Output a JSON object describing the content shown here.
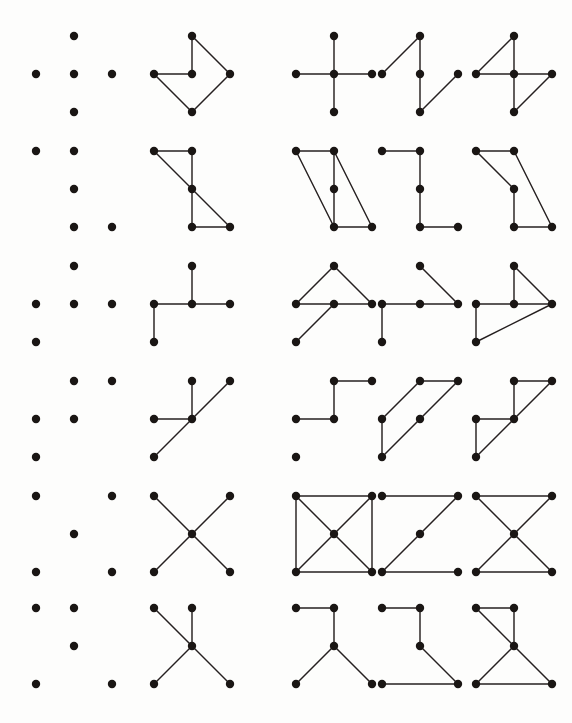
{
  "figure": {
    "background_color": "#fdfdfc",
    "dot_color": "#1a1614",
    "line_color": "#262020",
    "rows_count": 6,
    "columns_count": 5,
    "grid": {
      "cols_x": [
        14,
        52,
        90
      ],
      "rows_y": [
        16,
        54,
        92
      ],
      "dot_radius": 4.2
    },
    "column_x_offsets": [
      22,
      140,
      282,
      368,
      462
    ],
    "row_y_offsets": [
      20,
      135,
      250,
      365,
      480,
      592
    ],
    "rows": [
      {
        "row_index": 1,
        "pattern_name": "plus-cross",
        "dots": [
          {
            "id": "tc",
            "col": 1,
            "row": 0
          },
          {
            "id": "ml",
            "col": 0,
            "row": 1
          },
          {
            "id": "mc",
            "col": 1,
            "row": 1
          },
          {
            "id": "mr",
            "col": 2,
            "row": 1
          },
          {
            "id": "bc",
            "col": 1,
            "row": 2
          }
        ],
        "cells": [
          {
            "cell_index": 1,
            "name": "dots-only",
            "edges": []
          },
          {
            "cell_index": 2,
            "name": "arrowhead-figure",
            "edges": [
              [
                "tc",
                "mc"
              ],
              [
                "ml",
                "mc"
              ],
              [
                "tc",
                "mr"
              ],
              [
                "ml",
                "bc"
              ],
              [
                "bc",
                "mr"
              ]
            ]
          },
          {
            "cell_index": 3,
            "name": "full-plus-figure",
            "edges": [
              [
                "tc",
                "mc"
              ],
              [
                "ml",
                "mc"
              ],
              [
                "mc",
                "mr"
              ],
              [
                "mc",
                "bc"
              ]
            ]
          },
          {
            "cell_index": 4,
            "name": "zigzag-figure",
            "edges": [
              [
                "tc",
                "ml"
              ],
              [
                "tc",
                "mc"
              ],
              [
                "mc",
                "bc"
              ],
              [
                "bc",
                "mr"
              ]
            ]
          },
          {
            "cell_index": 5,
            "name": "four-figure",
            "edges": [
              [
                "tc",
                "ml"
              ],
              [
                "tc",
                "mc"
              ],
              [
                "ml",
                "mc"
              ],
              [
                "mc",
                "mr"
              ],
              [
                "mc",
                "bc"
              ],
              [
                "bc",
                "mr"
              ]
            ]
          }
        ]
      },
      {
        "row_index": 2,
        "pattern_name": "z-stack",
        "dots": [
          {
            "id": "tl",
            "col": 0,
            "row": 0
          },
          {
            "id": "tc",
            "col": 1,
            "row": 0
          },
          {
            "id": "mc",
            "col": 1,
            "row": 1
          },
          {
            "id": "bc",
            "col": 1,
            "row": 2
          },
          {
            "id": "br",
            "col": 2,
            "row": 2
          }
        ],
        "cells": [
          {
            "cell_index": 1,
            "name": "dots-only",
            "edges": []
          },
          {
            "cell_index": 2,
            "name": "z-figure",
            "edges": [
              [
                "tl",
                "tc"
              ],
              [
                "tl",
                "mc"
              ],
              [
                "tc",
                "mc"
              ],
              [
                "mc",
                "bc"
              ],
              [
                "mc",
                "br"
              ],
              [
                "bc",
                "br"
              ]
            ]
          },
          {
            "cell_index": 3,
            "name": "parallelogram-figure",
            "edges": [
              [
                "tl",
                "tc"
              ],
              [
                "tl",
                "bc"
              ],
              [
                "tc",
                "mc"
              ],
              [
                "mc",
                "bc"
              ],
              [
                "tc",
                "br"
              ],
              [
                "bc",
                "br"
              ]
            ]
          },
          {
            "cell_index": 4,
            "name": "l-figure",
            "edges": [
              [
                "tl",
                "tc"
              ],
              [
                "tc",
                "mc"
              ],
              [
                "mc",
                "bc"
              ],
              [
                "bc",
                "br"
              ]
            ]
          },
          {
            "cell_index": 5,
            "name": "seven-figure",
            "edges": [
              [
                "tl",
                "tc"
              ],
              [
                "tl",
                "mc"
              ],
              [
                "tc",
                "br"
              ],
              [
                "mc",
                "bc"
              ],
              [
                "bc",
                "br"
              ]
            ]
          }
        ]
      },
      {
        "row_index": 3,
        "pattern_name": "t-with-tail",
        "dots": [
          {
            "id": "tc",
            "col": 1,
            "row": 0
          },
          {
            "id": "ml",
            "col": 0,
            "row": 1
          },
          {
            "id": "mc",
            "col": 1,
            "row": 1
          },
          {
            "id": "mr",
            "col": 2,
            "row": 1
          },
          {
            "id": "bl",
            "col": 0,
            "row": 2
          }
        ],
        "cells": [
          {
            "cell_index": 1,
            "name": "dots-only",
            "edges": []
          },
          {
            "cell_index": 2,
            "name": "t-figure",
            "edges": [
              [
                "tc",
                "mc"
              ],
              [
                "ml",
                "mc"
              ],
              [
                "mc",
                "mr"
              ],
              [
                "ml",
                "bl"
              ]
            ]
          },
          {
            "cell_index": 3,
            "name": "triangle-tail-figure",
            "edges": [
              [
                "tc",
                "ml"
              ],
              [
                "tc",
                "mr"
              ],
              [
                "ml",
                "mc"
              ],
              [
                "mc",
                "mr"
              ],
              [
                "mc",
                "bl"
              ]
            ]
          },
          {
            "cell_index": 4,
            "name": "r-figure",
            "edges": [
              [
                "tc",
                "mr"
              ],
              [
                "ml",
                "mc"
              ],
              [
                "mc",
                "mr"
              ],
              [
                "ml",
                "bl"
              ]
            ]
          },
          {
            "cell_index": 5,
            "name": "kite-figure",
            "edges": [
              [
                "tc",
                "mc"
              ],
              [
                "tc",
                "mr"
              ],
              [
                "ml",
                "mc"
              ],
              [
                "mc",
                "mr"
              ],
              [
                "ml",
                "bl"
              ],
              [
                "bl",
                "mr"
              ]
            ]
          }
        ]
      },
      {
        "row_index": 4,
        "pattern_name": "diagonal-stair",
        "dots": [
          {
            "id": "tc",
            "col": 1,
            "row": 0
          },
          {
            "id": "tr",
            "col": 2,
            "row": 0
          },
          {
            "id": "ml",
            "col": 0,
            "row": 1
          },
          {
            "id": "mc",
            "col": 1,
            "row": 1
          },
          {
            "id": "bl",
            "col": 0,
            "row": 2
          }
        ],
        "cells": [
          {
            "cell_index": 1,
            "name": "dots-only",
            "edges": []
          },
          {
            "cell_index": 2,
            "name": "star-figure",
            "edges": [
              [
                "tc",
                "mc"
              ],
              [
                "ml",
                "mc"
              ],
              [
                "mc",
                "tr"
              ],
              [
                "mc",
                "bl"
              ]
            ]
          },
          {
            "cell_index": 3,
            "name": "step-figure",
            "edges": [
              [
                "tc",
                "tr"
              ],
              [
                "tc",
                "mc"
              ],
              [
                "ml",
                "mc"
              ]
            ]
          },
          {
            "cell_index": 4,
            "name": "double-diagonal-figure",
            "edges": [
              [
                "tc",
                "tr"
              ],
              [
                "tc",
                "ml"
              ],
              [
                "ml",
                "bl"
              ],
              [
                "mc",
                "tr"
              ],
              [
                "bl",
                "mc"
              ]
            ]
          },
          {
            "cell_index": 5,
            "name": "flag-figure",
            "edges": [
              [
                "tc",
                "tr"
              ],
              [
                "tc",
                "mc"
              ],
              [
                "ml",
                "mc"
              ],
              [
                "mc",
                "tr"
              ],
              [
                "ml",
                "bl"
              ],
              [
                "bl",
                "mc"
              ]
            ]
          }
        ]
      },
      {
        "row_index": 5,
        "pattern_name": "x-corners",
        "dots": [
          {
            "id": "tl",
            "col": 0,
            "row": 0
          },
          {
            "id": "tr",
            "col": 2,
            "row": 0
          },
          {
            "id": "mc",
            "col": 1,
            "row": 1
          },
          {
            "id": "bl",
            "col": 0,
            "row": 2
          },
          {
            "id": "br",
            "col": 2,
            "row": 2
          }
        ],
        "cells": [
          {
            "cell_index": 1,
            "name": "dots-only",
            "edges": []
          },
          {
            "cell_index": 2,
            "name": "x-figure",
            "edges": [
              [
                "tl",
                "mc"
              ],
              [
                "tr",
                "mc"
              ],
              [
                "bl",
                "mc"
              ],
              [
                "br",
                "mc"
              ]
            ]
          },
          {
            "cell_index": 3,
            "name": "boxed-x-figure",
            "edges": [
              [
                "tl",
                "tr"
              ],
              [
                "tl",
                "bl"
              ],
              [
                "tr",
                "br"
              ],
              [
                "bl",
                "br"
              ],
              [
                "tl",
                "mc"
              ],
              [
                "tr",
                "mc"
              ],
              [
                "bl",
                "mc"
              ],
              [
                "br",
                "mc"
              ]
            ]
          },
          {
            "cell_index": 4,
            "name": "z-figure",
            "edges": [
              [
                "tl",
                "tr"
              ],
              [
                "tr",
                "mc"
              ],
              [
                "mc",
                "bl"
              ],
              [
                "bl",
                "br"
              ]
            ]
          },
          {
            "cell_index": 5,
            "name": "bowtie-figure",
            "edges": [
              [
                "tl",
                "tr"
              ],
              [
                "bl",
                "br"
              ],
              [
                "tl",
                "mc"
              ],
              [
                "tr",
                "mc"
              ],
              [
                "bl",
                "mc"
              ],
              [
                "br",
                "mc"
              ]
            ]
          }
        ]
      },
      {
        "row_index": 6,
        "pattern_name": "y-spread",
        "dots": [
          {
            "id": "tl",
            "col": 0,
            "row": 0
          },
          {
            "id": "tc",
            "col": 1,
            "row": 0
          },
          {
            "id": "mc",
            "col": 1,
            "row": 1
          },
          {
            "id": "bl",
            "col": 0,
            "row": 2
          },
          {
            "id": "br",
            "col": 2,
            "row": 2
          }
        ],
        "cells": [
          {
            "cell_index": 1,
            "name": "dots-only",
            "edges": []
          },
          {
            "cell_index": 2,
            "name": "x-y-figure",
            "edges": [
              [
                "tl",
                "mc"
              ],
              [
                "tc",
                "mc"
              ],
              [
                "bl",
                "mc"
              ],
              [
                "br",
                "mc"
              ]
            ]
          },
          {
            "cell_index": 3,
            "name": "y-figure",
            "edges": [
              [
                "tl",
                "tc"
              ],
              [
                "tc",
                "mc"
              ],
              [
                "mc",
                "bl"
              ],
              [
                "mc",
                "br"
              ]
            ]
          },
          {
            "cell_index": 4,
            "name": "z-figure",
            "edges": [
              [
                "tl",
                "tc"
              ],
              [
                "tc",
                "mc"
              ],
              [
                "mc",
                "br"
              ],
              [
                "bl",
                "br"
              ]
            ]
          },
          {
            "cell_index": 5,
            "name": "bowtie-stack-figure",
            "edges": [
              [
                "tl",
                "tc"
              ],
              [
                "tl",
                "mc"
              ],
              [
                "tc",
                "mc"
              ],
              [
                "mc",
                "bl"
              ],
              [
                "mc",
                "br"
              ],
              [
                "bl",
                "br"
              ]
            ]
          }
        ]
      }
    ]
  }
}
